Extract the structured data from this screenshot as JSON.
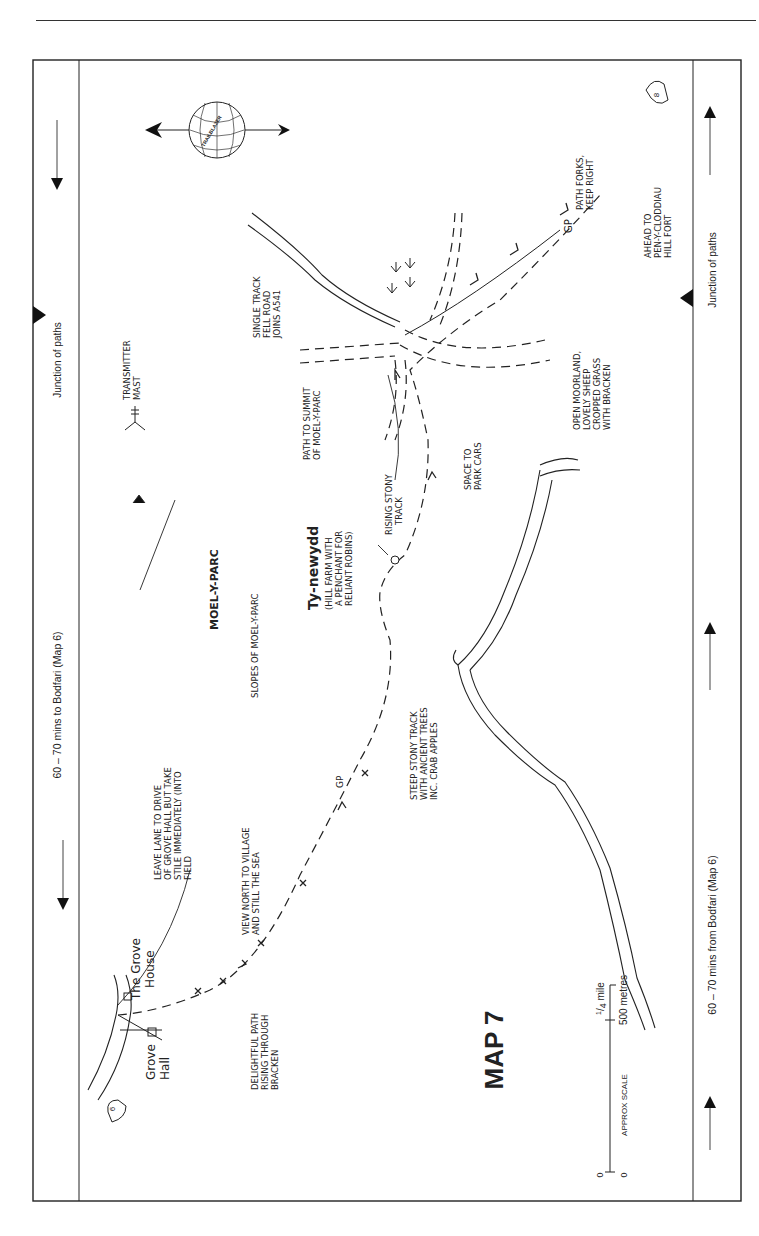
{
  "page": {
    "header_fragment": "...walking ... map ... the way ...",
    "map_title": "MAP 7",
    "publisher_badge": "TRAILBLAZER"
  },
  "strips": {
    "left": {
      "junction_label": "Junction of paths",
      "direction_label": "60 – 70 mins to Bodfari (Map 6)"
    },
    "right": {
      "junction_label": "Junction of paths",
      "direction_label": "60 – 70 mins from Bodfari (Map 6)"
    }
  },
  "map_markers": {
    "prev_map": "6",
    "next_map": "8"
  },
  "scale": {
    "label": "APPROX SCALE",
    "zero_left": "0",
    "zero_right": "0",
    "mile": "1/4 mile",
    "mile_num": "1",
    "mile_den": "4",
    "mile_unit": "mile",
    "metres": "500 metres"
  },
  "places": {
    "grove_hall": [
      "Grove",
      "Hall"
    ],
    "grove_house": [
      "The Grove",
      "House"
    ],
    "moel_y_parc": "MOEL-Y-PARC",
    "ty_newydd": "Ty-newydd",
    "transmitter": [
      "TRANSMITTER",
      "MAST"
    ]
  },
  "annotations": {
    "leave_lane": [
      "LEAVE LANE TO DRIVE",
      "OF GROVE HALL BUT TAKE",
      "STILE IMMEDIATELY (INTO",
      "FIELD"
    ],
    "delightful_path": [
      "DELIGHTFUL PATH",
      "RISING THROUGH",
      "BRACKEN"
    ],
    "view_north": [
      "VIEW NORTH TO VILLAGE",
      "AND STILL THE SEA"
    ],
    "gp1": "GP",
    "slopes": "SLOPES OF MOEL-Y-PARC",
    "steep_track": [
      "STEEP STONY TRACK",
      "WITH ANCIENT TREES",
      "INC. CRAB APPLES"
    ],
    "hill_farm": [
      "(HILL FARM WITH",
      "A PENCHANT FOR",
      "RELIANT ROBINS)"
    ],
    "rising_track": [
      "RISING STONY",
      "TRACK"
    ],
    "path_summit": [
      "PATH TO SUMMIT",
      "OF MOEL-Y-PARC"
    ],
    "space_park": [
      "SPACE TO",
      "PARK CARS"
    ],
    "single_track": [
      "SINGLE TRACK",
      "FELL ROAD",
      "JOINS A541"
    ],
    "open_moorland": [
      "OPEN MOORLAND,",
      "LOVELY SHEEP",
      "CROPPED GRASS",
      "WITH BRACKEN"
    ],
    "gp2": "GP",
    "path_forks": [
      "PATH FORKS,",
      "KEEP RIGHT"
    ],
    "ahead_to": [
      "AHEAD TO",
      "PEN-Y-CLODDIAU",
      "HILL FORT"
    ]
  },
  "colors": {
    "ink": "#222222",
    "paper": "#ffffff"
  }
}
